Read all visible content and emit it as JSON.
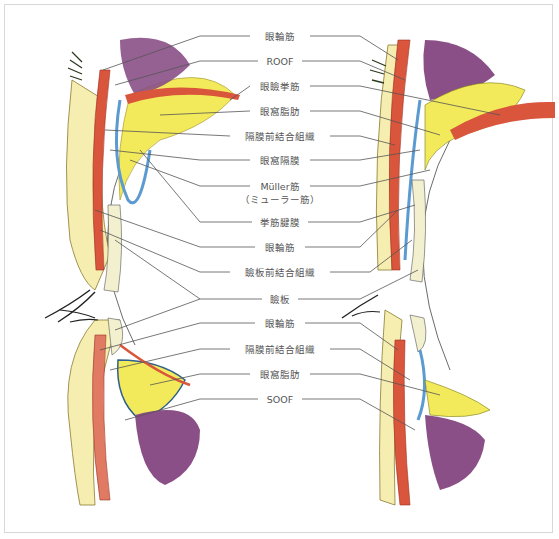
{
  "diagram": {
    "colors": {
      "muscle_red": "#d9553b",
      "fat_yellow": "#f2ea5a",
      "septum_blue": "#5b9bd1",
      "orbit_purple": "#8a4f86",
      "skin_cream": "#f6eeb0",
      "line_gray": "#555555",
      "frame": "#d8d8d8"
    },
    "labels": [
      {
        "id": "orbicularis-upper",
        "text": "眼輪筋",
        "x": 280,
        "y": 36
      },
      {
        "id": "roof",
        "text": "ROOF",
        "x": 280,
        "y": 61
      },
      {
        "id": "levator",
        "text": "眼瞼挙筋",
        "x": 280,
        "y": 86
      },
      {
        "id": "orbital-fat-upper",
        "text": "眼窩脂肪",
        "x": 280,
        "y": 111
      },
      {
        "id": "preseptal-connective-upper",
        "text": "隔膜前結合組織",
        "x": 280,
        "y": 136
      },
      {
        "id": "orbital-septum",
        "text": "眼窩隔膜",
        "x": 280,
        "y": 160
      },
      {
        "id": "muller-muscle",
        "text": "Müller筋",
        "x": 280,
        "y": 186
      },
      {
        "id": "muller-muscle-kana",
        "text": "（ミューラー筋）",
        "x": 280,
        "y": 199
      },
      {
        "id": "levator-aponeurosis",
        "text": "挙筋腱膜",
        "x": 280,
        "y": 222
      },
      {
        "id": "orbicularis-mid",
        "text": "眼輪筋",
        "x": 280,
        "y": 247
      },
      {
        "id": "pretarsal-connective",
        "text": "瞼板前結合組織",
        "x": 280,
        "y": 272
      },
      {
        "id": "tarsus",
        "text": "瞼板",
        "x": 280,
        "y": 299
      },
      {
        "id": "orbicularis-lower",
        "text": "眼輪筋",
        "x": 280,
        "y": 323
      },
      {
        "id": "preseptal-connective-lower",
        "text": "隔膜前結合組織",
        "x": 280,
        "y": 349
      },
      {
        "id": "orbital-fat-lower",
        "text": "眼窩脂肪",
        "x": 280,
        "y": 374
      },
      {
        "id": "soof",
        "text": "SOOF",
        "x": 280,
        "y": 399
      }
    ]
  }
}
